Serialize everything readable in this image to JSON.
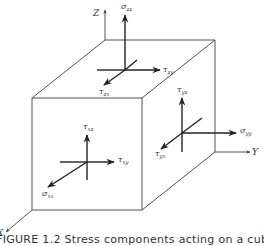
{
  "figure": {
    "caption": "FIGURE 1.2   Stress components acting on a cube",
    "axes": {
      "z": "Z",
      "y": "Y",
      "x": "X"
    },
    "top_face": {
      "normal": {
        "sym": "σ",
        "sub": "zz"
      },
      "shear_y": {
        "sym": "τ",
        "sub": "zy"
      },
      "shear_x": {
        "sym": "τ",
        "sub": "zx"
      }
    },
    "front_face": {
      "normal": {
        "sym": "σ",
        "sub": "xx"
      },
      "shear_y": {
        "sym": "τ",
        "sub": "xy"
      },
      "shear_z": {
        "sym": "τ",
        "sub": "xz"
      }
    },
    "right_face": {
      "normal": {
        "sym": "σ",
        "sub": "yy"
      },
      "shear_z": {
        "sym": "τ",
        "sub": "yz"
      },
      "shear_x": {
        "sym": "τ",
        "sub": "yx"
      }
    },
    "colors": {
      "line": "#444444",
      "arrow": "#222222",
      "text": "#333333"
    }
  }
}
